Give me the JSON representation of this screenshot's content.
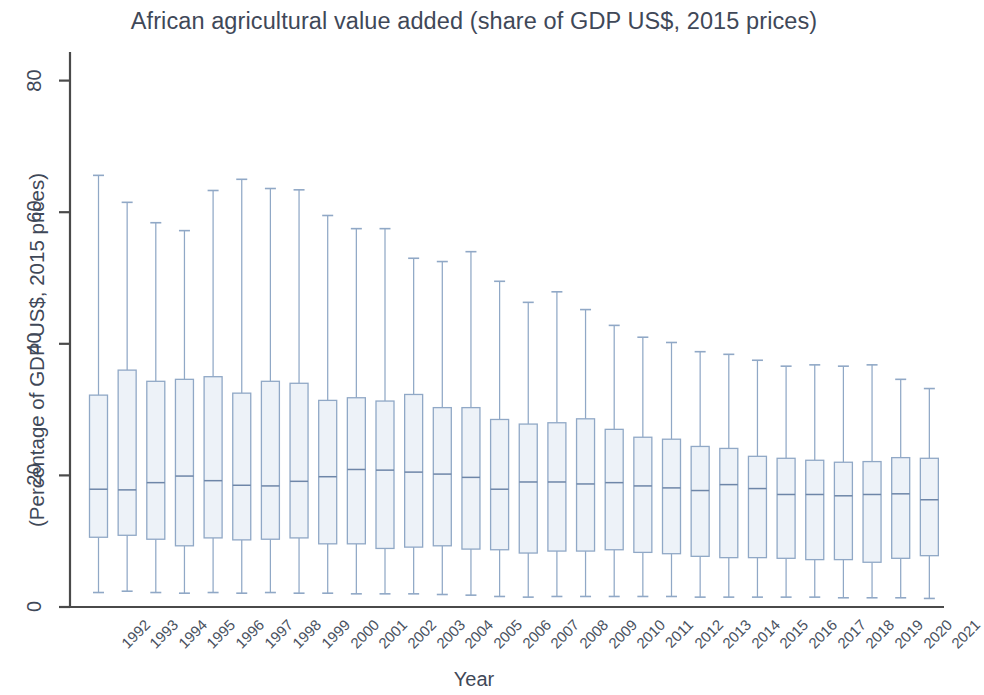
{
  "chart_data": {
    "type": "box",
    "title": "African agricultural value added (share of GDP US$, 2015 prices)",
    "xlabel": "Year",
    "ylabel": "(Percentage of GDP US$, 2015 prices)",
    "ylim": [
      0,
      85
    ],
    "yticks": [
      0,
      20,
      40,
      60,
      80
    ],
    "ytick_labels": [
      "0",
      "20",
      "40",
      "60",
      "80"
    ],
    "grid": false,
    "legend": null,
    "categories": [
      "1992",
      "1993",
      "1994",
      "1995",
      "1996",
      "1997",
      "1998",
      "1999",
      "2000",
      "2001",
      "2002",
      "2003",
      "2004",
      "2005",
      "2006",
      "2007",
      "2008",
      "2009",
      "2010",
      "2011",
      "2012",
      "2013",
      "2014",
      "2015",
      "2016",
      "2017",
      "2018",
      "2019",
      "2020",
      "2021"
    ],
    "boxes": [
      {
        "year": "1992",
        "whisker_low": 2.2,
        "q1": 10.6,
        "median": 17.9,
        "q3": 32.2,
        "whisker_high": 65.6
      },
      {
        "year": "1993",
        "whisker_low": 2.4,
        "q1": 10.9,
        "median": 17.8,
        "q3": 36.0,
        "whisker_high": 61.5
      },
      {
        "year": "1994",
        "whisker_low": 2.2,
        "q1": 10.3,
        "median": 18.9,
        "q3": 34.3,
        "whisker_high": 58.4
      },
      {
        "year": "1995",
        "whisker_low": 2.1,
        "q1": 9.3,
        "median": 19.9,
        "q3": 34.6,
        "whisker_high": 57.2
      },
      {
        "year": "1996",
        "whisker_low": 2.2,
        "q1": 10.5,
        "median": 19.2,
        "q3": 35.0,
        "whisker_high": 63.3
      },
      {
        "year": "1997",
        "whisker_low": 2.1,
        "q1": 10.2,
        "median": 18.5,
        "q3": 32.5,
        "whisker_high": 65.0
      },
      {
        "year": "1998",
        "whisker_low": 2.2,
        "q1": 10.3,
        "median": 18.4,
        "q3": 34.3,
        "whisker_high": 63.6
      },
      {
        "year": "1999",
        "whisker_low": 2.1,
        "q1": 10.5,
        "median": 19.1,
        "q3": 34.0,
        "whisker_high": 63.4
      },
      {
        "year": "2000",
        "whisker_low": 2.1,
        "q1": 9.6,
        "median": 19.8,
        "q3": 31.4,
        "whisker_high": 59.5
      },
      {
        "year": "2001",
        "whisker_low": 2.0,
        "q1": 9.6,
        "median": 20.9,
        "q3": 31.8,
        "whisker_high": 57.5
      },
      {
        "year": "2002",
        "whisker_low": 2.0,
        "q1": 8.9,
        "median": 20.8,
        "q3": 31.3,
        "whisker_high": 57.5
      },
      {
        "year": "2003",
        "whisker_low": 2.0,
        "q1": 9.1,
        "median": 20.5,
        "q3": 32.3,
        "whisker_high": 53.0
      },
      {
        "year": "2004",
        "whisker_low": 1.9,
        "q1": 9.3,
        "median": 20.2,
        "q3": 30.3,
        "whisker_high": 52.5
      },
      {
        "year": "2005",
        "whisker_low": 1.8,
        "q1": 8.8,
        "median": 19.7,
        "q3": 30.3,
        "whisker_high": 54.0
      },
      {
        "year": "2006",
        "whisker_low": 1.6,
        "q1": 8.7,
        "median": 17.9,
        "q3": 28.5,
        "whisker_high": 49.5
      },
      {
        "year": "2007",
        "whisker_low": 1.5,
        "q1": 8.2,
        "median": 19.0,
        "q3": 27.8,
        "whisker_high": 46.3
      },
      {
        "year": "2008",
        "whisker_low": 1.6,
        "q1": 8.5,
        "median": 19.0,
        "q3": 28.0,
        "whisker_high": 47.9
      },
      {
        "year": "2009",
        "whisker_low": 1.6,
        "q1": 8.5,
        "median": 18.7,
        "q3": 28.6,
        "whisker_high": 45.2
      },
      {
        "year": "2010",
        "whisker_low": 1.6,
        "q1": 8.7,
        "median": 18.9,
        "q3": 27.0,
        "whisker_high": 42.8
      },
      {
        "year": "2011",
        "whisker_low": 1.6,
        "q1": 8.3,
        "median": 18.4,
        "q3": 25.8,
        "whisker_high": 41.0
      },
      {
        "year": "2012",
        "whisker_low": 1.6,
        "q1": 8.1,
        "median": 18.1,
        "q3": 25.5,
        "whisker_high": 40.2
      },
      {
        "year": "2013",
        "whisker_low": 1.5,
        "q1": 7.7,
        "median": 17.7,
        "q3": 24.4,
        "whisker_high": 38.8
      },
      {
        "year": "2014",
        "whisker_low": 1.5,
        "q1": 7.5,
        "median": 18.6,
        "q3": 24.1,
        "whisker_high": 38.4
      },
      {
        "year": "2015",
        "whisker_low": 1.5,
        "q1": 7.5,
        "median": 18.0,
        "q3": 22.9,
        "whisker_high": 37.5
      },
      {
        "year": "2016",
        "whisker_low": 1.5,
        "q1": 7.4,
        "median": 17.1,
        "q3": 22.6,
        "whisker_high": 36.6
      },
      {
        "year": "2017",
        "whisker_low": 1.5,
        "q1": 7.2,
        "median": 17.1,
        "q3": 22.3,
        "whisker_high": 36.8
      },
      {
        "year": "2018",
        "whisker_low": 1.4,
        "q1": 7.2,
        "median": 16.9,
        "q3": 22.0,
        "whisker_high": 36.6
      },
      {
        "year": "2019",
        "whisker_low": 1.4,
        "q1": 6.8,
        "median": 17.1,
        "q3": 22.1,
        "whisker_high": 36.8
      },
      {
        "year": "2020",
        "whisker_low": 1.4,
        "q1": 7.4,
        "median": 17.2,
        "q3": 22.7,
        "whisker_high": 34.6
      },
      {
        "year": "2021",
        "whisker_low": 1.3,
        "q1": 7.8,
        "median": 16.3,
        "q3": 22.6,
        "whisker_high": 33.2
      }
    ],
    "colors": {
      "box_fill": "#edf2f8",
      "box_border": "#90a8c6",
      "whisker": "#90a8c6",
      "median": "#6e86a8",
      "axis": "#4a4a4a",
      "title_text": "#3f4858",
      "tick_text": "#4a525f"
    }
  }
}
